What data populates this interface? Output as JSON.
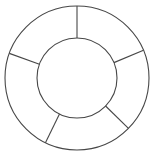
{
  "diagram": {
    "type": "segmented-ring",
    "center": [
      77,
      78
    ],
    "outer_radius": 72,
    "inner_radius": 40,
    "stroke_color": "#474747",
    "fill_color": "#ffffff",
    "background": "#ffffff",
    "segment_count": 5,
    "divider_angles_deg": [
      90,
      22.6,
      -44.4,
      -116,
      160
    ],
    "segments": [
      {
        "label": ""
      },
      {
        "label": ""
      },
      {
        "label": ""
      },
      {
        "label": ""
      },
      {
        "label": ""
      }
    ]
  }
}
